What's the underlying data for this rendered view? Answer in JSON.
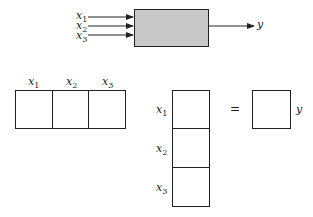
{
  "top_diagram": {
    "inputs": [
      {
        "name": "x",
        "sub": "1"
      },
      {
        "name": "x",
        "sub": "2"
      },
      {
        "name": "x",
        "sub": "3"
      }
    ],
    "output": "y",
    "box_fill": "#c8c8c8"
  },
  "row_vector": {
    "labels": [
      {
        "name": "x",
        "sub": "1"
      },
      {
        "name": "x",
        "sub": "2"
      },
      {
        "name": "x",
        "sub": "3"
      }
    ]
  },
  "column_vector": {
    "labels": [
      {
        "name": "x",
        "sub": "1"
      },
      {
        "name": "x",
        "sub": "2"
      },
      {
        "name": "x",
        "sub": "3"
      }
    ]
  },
  "equals": "=",
  "result_label": "y"
}
